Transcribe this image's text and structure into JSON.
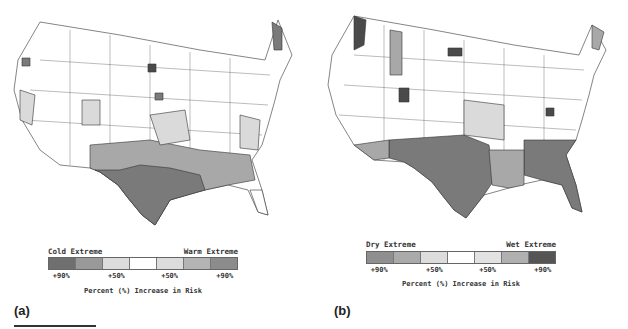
{
  "figure": {
    "panels": [
      {
        "label": "(a)",
        "legend": {
          "left_title": "Cold Extreme",
          "right_title": "Warm Extreme",
          "swatch_colors": [
            "#6f6f6f",
            "#999999",
            "#dcdcdc",
            "#ffffff",
            "#dcdcdc",
            "#b4b4b4",
            "#8c8c8c"
          ],
          "ticks": [
            "+90%",
            "+50%",
            "+50%",
            "+90%"
          ],
          "axis_label": "Percent (%) Increase in Risk"
        }
      },
      {
        "label": "(b)",
        "legend": {
          "left_title": "Dry Extreme",
          "right_title": "Wet Extreme",
          "swatch_colors": [
            "#8f8f8f",
            "#aaaaaa",
            "#dcdcdc",
            "#ffffff",
            "#e2e2e2",
            "#b0b0b0",
            "#555555"
          ],
          "ticks": [
            "+90%",
            "+50%",
            "+50%",
            "+90%"
          ],
          "axis_label": "Percent (%) Increase in Risk"
        }
      }
    ],
    "map_colors": {
      "strong": "#7a7a7a",
      "medium": "#a8a8a8",
      "light": "#dadada",
      "none": "#ffffff",
      "darkest": "#4a4a4a"
    }
  }
}
